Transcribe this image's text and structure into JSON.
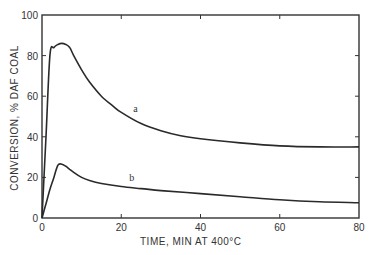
{
  "chart_data": {
    "type": "line",
    "title": "",
    "xlabel": "TIME, MIN AT 400°C",
    "ylabel": "CONVERSION, % DAF COAL",
    "xlim": [
      0,
      80
    ],
    "ylim": [
      0,
      100
    ],
    "x_ticks": [
      0,
      20,
      40,
      60,
      80
    ],
    "y_ticks": [
      0,
      20,
      40,
      60,
      80,
      100
    ],
    "grid": false,
    "legend": "none (curves labeled inline 'a' and 'b')",
    "series": [
      {
        "name": "a",
        "label_position": {
          "x": 23,
          "y": 54
        },
        "x": [
          0,
          1,
          2,
          3,
          4,
          5,
          6,
          7,
          8,
          10,
          12,
          15,
          18,
          20,
          25,
          30,
          35,
          40,
          50,
          60,
          70,
          80
        ],
        "y": [
          0,
          40,
          80,
          84,
          85.5,
          86,
          85.5,
          84,
          80,
          73,
          67,
          60,
          55,
          52,
          46.5,
          43,
          40.5,
          39,
          37,
          35.5,
          35,
          35
        ]
      },
      {
        "name": "b",
        "label_position": {
          "x": 22,
          "y": 20
        },
        "x": [
          0,
          1,
          2,
          3,
          4,
          5,
          6,
          7,
          8,
          10,
          12,
          15,
          20,
          25,
          30,
          40,
          50,
          60,
          70,
          80
        ],
        "y": [
          0,
          7,
          14,
          20,
          26,
          26.5,
          25.5,
          24,
          22.5,
          20,
          18.5,
          17,
          15.5,
          14.5,
          13.5,
          12,
          10.5,
          9,
          8,
          7.5
        ]
      }
    ]
  },
  "axes": {
    "x_title": "TIME, MIN AT 400°C",
    "y_title": "CONVERSION, % DAF COAL",
    "x_tick_labels": [
      "0",
      "20",
      "40",
      "60",
      "80"
    ],
    "y_tick_labels": [
      "0",
      "20",
      "40",
      "60",
      "80",
      "100"
    ]
  },
  "labels": {
    "curve_a": "a",
    "curve_b": "b"
  }
}
